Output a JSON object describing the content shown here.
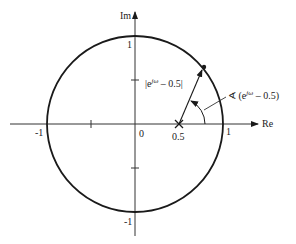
{
  "diagram": {
    "type": "complex-plane-unit-circle",
    "axes": {
      "real_label": "Re",
      "imag_label": "Im"
    },
    "tick_labels": {
      "real_neg_one": "-1",
      "origin": "0",
      "real_half": "0.5",
      "real_one": "1",
      "imag_one": "1",
      "imag_neg_one": "-1"
    },
    "annotations": {
      "magnitude": "|eʲʷ – 0.5|",
      "magnitude_parts": {
        "open": "|e",
        "sup": "jω",
        "close": " – 0.5|"
      },
      "angle_parts": {
        "prefix": "∢ (e",
        "sup": "jω",
        "close": " – 0.5)"
      }
    },
    "points": {
      "zero_marker": "0.5",
      "point_on_circle": "e^{jω}"
    },
    "colors": {
      "stroke": "#1a1a1a",
      "axis": "#333333",
      "text": "#222222"
    }
  }
}
